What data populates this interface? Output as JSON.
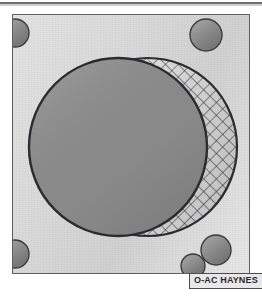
{
  "figure": {
    "title": "O-AC HAYNES",
    "kind": "technical-line-drawing",
    "caption_label": "O-AC HAYNES"
  },
  "colors": {
    "page_background": "#ffffff",
    "plate_fill_light": "#e4e4e4",
    "plate_fill_dark": "#d2d2d2",
    "outline": "#2b2c2f",
    "plate_border": "#5d5f63",
    "disc_fill": "#8c8c8c",
    "lune_fill": "#d8d8d8",
    "hatch_line": "#2e2f32",
    "bolt_fill": "#8a8a8a",
    "label_fill": "#e8e8e8",
    "label_text": "#28292c",
    "top_rule": "#55565a"
  },
  "plate": {
    "name": "mounting-plate",
    "x": 12,
    "y": 14,
    "width": 238,
    "height": 260
  },
  "top_rule": {
    "name": "scan-edge-rule",
    "y": 2,
    "height": 2
  },
  "main_disc": {
    "name": "primary-disc",
    "cx": 118,
    "cy": 147,
    "r": 89,
    "fill": "#8c8c8c"
  },
  "offset_disc": {
    "name": "secondary-disc",
    "cx": 148,
    "cy": 147,
    "r": 89,
    "fill": "#d8d8d8",
    "pattern": "cross-hatch"
  },
  "hatch": {
    "name": "cross-hatch-pattern",
    "angle_deg": 45,
    "spacing_px": 9,
    "stroke_width": 1.1
  },
  "bolt_holes": [
    {
      "name": "bolt-hole-top-left",
      "cx": 15,
      "cy": 33,
      "r": 14,
      "clipped": true
    },
    {
      "name": "bolt-hole-top-right",
      "cx": 206,
      "cy": 35,
      "r": 16,
      "clipped": false
    },
    {
      "name": "bolt-hole-bottom-left",
      "cx": 15,
      "cy": 254,
      "r": 14,
      "clipped": true
    },
    {
      "name": "bolt-hole-bottom-right",
      "cx": 216,
      "cy": 250,
      "r": 15,
      "clipped": false
    },
    {
      "name": "bolt-hole-bottom-inner",
      "cx": 193,
      "cy": 266,
      "r": 12,
      "clipped": false
    }
  ],
  "label": {
    "name": "part-label",
    "text": "O-AC HAYNES",
    "x": 189,
    "y": 273
  }
}
